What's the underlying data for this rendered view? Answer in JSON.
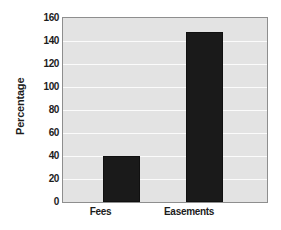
{
  "chart_data": {
    "type": "bar",
    "title": "",
    "xlabel": "",
    "ylabel": "Percentage",
    "categories": [
      "Fees",
      "Easements"
    ],
    "values": [
      40,
      148
    ],
    "ylim": [
      0,
      160
    ],
    "yticks": [
      0,
      20,
      40,
      60,
      80,
      100,
      120,
      140,
      160
    ],
    "ytick_labels": [
      "0",
      "20",
      "40",
      "60",
      "80",
      "100",
      "120",
      "140",
      "160"
    ],
    "grid": true,
    "grid_orientation": "horizontal",
    "legend": false,
    "legend_position": "none",
    "colors": {
      "bar": "#1a1a1a",
      "plot_background": "#e3e3e3",
      "figure_background": "#ffffff",
      "gridline": "#fbfbfb",
      "axis_border": "#8e8e8e",
      "text": "#1c1c1c"
    }
  }
}
